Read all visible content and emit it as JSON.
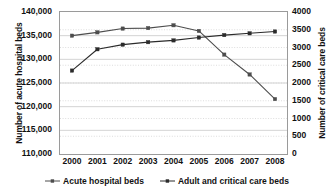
{
  "chart_data": {
    "type": "line",
    "title": "",
    "xlabel": "",
    "categories": [
      "2000",
      "2001",
      "2002",
      "2003",
      "2004",
      "2005",
      "2006",
      "2007",
      "2008"
    ],
    "grid": true,
    "legend_position": "bottom",
    "series": [
      {
        "name": "Acute hospital beds",
        "axis": "left",
        "marker": "square",
        "color": "#4d4d4d",
        "values": [
          135000,
          135700,
          136500,
          136600,
          137200,
          136000,
          131000,
          126800,
          121600
        ]
      },
      {
        "name": "Adult and critical care beds",
        "axis": "right",
        "marker": "square",
        "color": "#2b2b2b",
        "values": [
          2350,
          2950,
          3080,
          3150,
          3200,
          3280,
          3350,
          3400,
          3450
        ]
      }
    ],
    "left_axis": {
      "label": "Number of acute hospital beds",
      "ylim": [
        110000,
        140000
      ],
      "ticks": [
        110000,
        115000,
        120000,
        125000,
        130000,
        135000,
        140000
      ],
      "tick_labels": [
        "110,000",
        "115,000",
        "120,000",
        "125,000",
        "130,000",
        "135,000",
        "140,000"
      ]
    },
    "right_axis": {
      "label": "Number of critical care beds",
      "ylim": [
        0,
        4000
      ],
      "ticks": [
        0,
        500,
        1000,
        1500,
        2000,
        2500,
        3000,
        3500,
        4000
      ],
      "tick_labels": [
        "0",
        "500",
        "1000",
        "1500",
        "2000",
        "2500",
        "3000",
        "3500",
        "4000"
      ]
    },
    "legend": [
      {
        "label": "Acute hospital beds",
        "color": "#4d4d4d"
      },
      {
        "label": "Adult and critical care beds",
        "color": "#2b2b2b"
      }
    ]
  }
}
